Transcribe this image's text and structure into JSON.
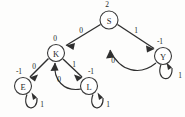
{
  "diagram": {
    "type": "directed-graph",
    "colors": {
      "stroke": "#2f2f2f",
      "node_fill": "#ffffff",
      "node_stroke": "#3a3a3a",
      "text": "#1f1f1f",
      "background": "#fdfdfc"
    },
    "nodes": [
      {
        "id": "S",
        "label": "S",
        "value": "2",
        "x": 109,
        "y": 20,
        "r": 9,
        "value_x": 107,
        "value_y": 4
      },
      {
        "id": "K",
        "label": "K",
        "value": "0",
        "x": 56,
        "y": 53,
        "r": 8.5,
        "value_x": 55,
        "value_y": 38
      },
      {
        "id": "Y",
        "label": "Y",
        "value": "-1",
        "x": 163,
        "y": 56,
        "r": 8.5,
        "value_x": 160,
        "value_y": 41
      },
      {
        "id": "E",
        "label": "E",
        "value": "-1",
        "x": 23,
        "y": 86,
        "r": 8.5,
        "value_x": 19,
        "value_y": 71
      },
      {
        "id": "L",
        "label": "L",
        "value": "-1",
        "x": 89,
        "y": 86,
        "r": 8.5,
        "value_x": 91,
        "value_y": 71
      }
    ],
    "edges": [
      {
        "from": "S",
        "to": "K",
        "label": "0",
        "label_x": 81,
        "label_y": 30
      },
      {
        "from": "S",
        "to": "Y",
        "label": "1",
        "label_x": 136,
        "label_y": 30
      },
      {
        "from": "Y",
        "to": "S",
        "label": "0",
        "label_x": 113,
        "label_y": 60
      },
      {
        "from": "K",
        "to": "E",
        "label": "0",
        "label_x": 34,
        "label_y": 66
      },
      {
        "from": "K",
        "to": "L",
        "label": "1",
        "label_x": 74,
        "label_y": 64
      },
      {
        "from": "L",
        "to": "K",
        "label": "0",
        "label_x": 59,
        "label_y": 79
      },
      {
        "from": "E",
        "to": "E",
        "label": "1",
        "label_x": 42,
        "label_y": 104,
        "self_loop": true
      },
      {
        "from": "L",
        "to": "L",
        "label": "1",
        "label_x": 108,
        "label_y": 104,
        "self_loop": true
      },
      {
        "from": "Y",
        "to": "Y",
        "label": "1",
        "label_x": 180,
        "label_y": 75,
        "self_loop": true
      }
    ]
  }
}
